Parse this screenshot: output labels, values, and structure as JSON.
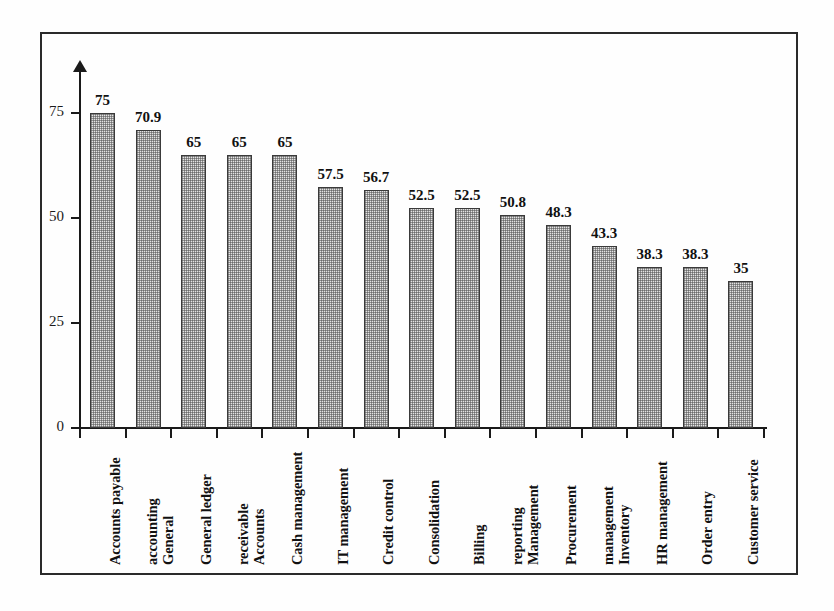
{
  "chart_data": {
    "type": "bar",
    "title": "",
    "subtitle": "",
    "xlabel": "",
    "ylabel": "",
    "ylim": [
      0,
      75
    ],
    "yticks": [
      0,
      25,
      50,
      75
    ],
    "ytick_labels": [
      "0",
      "25",
      "50",
      "75"
    ],
    "grid": false,
    "legend": false,
    "orientation": "vertical",
    "bar_fill": "dotted-halftone-gray",
    "categories": [
      "Accounts payable",
      "General accounting",
      "General ledger",
      "Accounts receivable",
      "Cash management",
      "IT management",
      "Credit control",
      "Consolidation",
      "Billing",
      "Management reporting",
      "Procurement",
      "Inventory management",
      "HR management",
      "Order entry",
      "Customer service"
    ],
    "category_lines": [
      [
        "Accounts payable"
      ],
      [
        "General",
        "accounting"
      ],
      [
        "General ledger"
      ],
      [
        "Accounts",
        "receivable"
      ],
      [
        "Cash management"
      ],
      [
        "IT management"
      ],
      [
        "Credit control"
      ],
      [
        "Consolidation"
      ],
      [
        "Billing"
      ],
      [
        "Management",
        "reporting"
      ],
      [
        "Procurement"
      ],
      [
        "Inventory",
        "management"
      ],
      [
        "HR management"
      ],
      [
        "Order entry"
      ],
      [
        "Customer service"
      ]
    ],
    "values": [
      75,
      70.9,
      65,
      65,
      65,
      57.5,
      56.7,
      52.5,
      52.5,
      50.8,
      48.3,
      43.3,
      38.3,
      38.3,
      35
    ],
    "value_labels": [
      "75",
      "70.9",
      "65",
      "65",
      "65",
      "57.5",
      "56.7",
      "52.5",
      "52.5",
      "50.8",
      "48.3",
      "43.3",
      "38.3",
      "38.3",
      "35"
    ]
  },
  "colors": {
    "bar_fill": "#e3e3e3",
    "bar_border": "#3a3a3a",
    "axis": "#1a1a1a",
    "text": "#111111",
    "frame": "#2a2a2a",
    "background": "#fefefe"
  }
}
